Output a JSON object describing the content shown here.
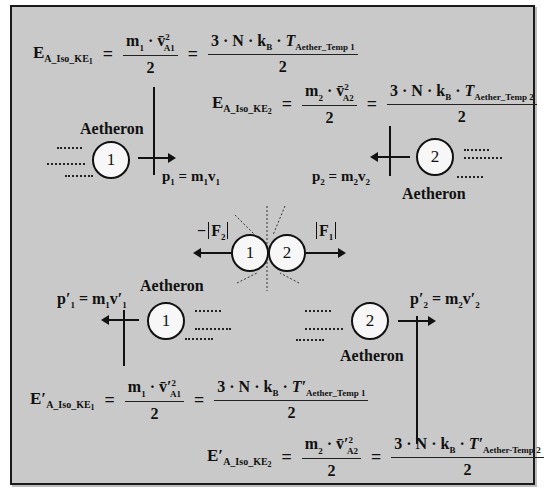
{
  "diagram": {
    "background_color": "#c9c9c9",
    "border_color": "#1a1a1a",
    "equations": {
      "ke1": {
        "lhs_main": "E",
        "lhs_sub": "A_Iso_KE",
        "lhs_subsub": "1",
        "num_mid": "m₁ · v̄²A1",
        "num_m": "m",
        "num_m_sub": "1",
        "num_v": "v̄",
        "num_v_sup": "2",
        "num_v_sub": "A1",
        "den": "2",
        "rhs_num_prefix": "3 · N · k",
        "rhs_kb_sub": "B",
        "rhs_T": "T",
        "rhs_T_sub": "Aether_Temp",
        "rhs_T_subsub": "1",
        "rhs_den": "2",
        "equals": "="
      },
      "ke2": {
        "lhs_main": "E",
        "lhs_sub": "A_Iso_KE",
        "lhs_subsub": "2",
        "num_m": "m",
        "num_m_sub": "2",
        "num_v": "v̄",
        "num_v_sup": "2",
        "num_v_sub": "A2",
        "den": "2",
        "rhs_num_prefix": "3 · N · k",
        "rhs_kb_sub": "B",
        "rhs_T": "T",
        "rhs_T_sub": "Aether_Temp",
        "rhs_T_subsub": "2",
        "rhs_den": "2",
        "equals": "="
      },
      "ke1_prime": {
        "lhs_main": "E′",
        "lhs_sub": "A_Iso_KE",
        "lhs_subsub": "1",
        "num_m": "m",
        "num_m_sub": "1",
        "num_v": "v̄′",
        "num_v_sup": "2",
        "num_v_sub": "A1",
        "den": "2",
        "rhs_num_prefix": "3 · N · k",
        "rhs_kb_sub": "B",
        "rhs_T": "T′",
        "rhs_T_sub": "Aether_Temp",
        "rhs_T_subsub": "1",
        "rhs_den": "2",
        "equals": "="
      },
      "ke2_prime": {
        "lhs_main": "E′",
        "lhs_sub": "A_Iso_KE",
        "lhs_subsub": "2",
        "num_m": "m",
        "num_m_sub": "2",
        "num_v": "v̄′",
        "num_v_sup": "2",
        "num_v_sub": "A2",
        "den": "2",
        "rhs_num_prefix": "3 · N · k",
        "rhs_kb_sub": "B",
        "rhs_T": "T′",
        "rhs_T_sub": "Aether-Temp",
        "rhs_T_subsub": "2",
        "rhs_den": "2",
        "equals": "="
      }
    },
    "particles": {
      "before_1": {
        "number": "1",
        "label": "Aetheron",
        "momentum_p": "p",
        "momentum_sub": "1",
        "momentum_rhs": " = m",
        "momentum_m_sub": "1",
        "momentum_v": "v",
        "momentum_v_sub": "1"
      },
      "before_2": {
        "number": "2",
        "label": "Aetheron",
        "momentum_p": "p",
        "momentum_sub": "2",
        "momentum_rhs": " = m",
        "momentum_m_sub": "2",
        "momentum_v": "v",
        "momentum_v_sub": "2"
      },
      "collision_1": {
        "number": "1"
      },
      "collision_2": {
        "number": "2"
      },
      "after_1": {
        "number": "1",
        "label": "Aetheron",
        "momentum_p": "p′",
        "momentum_sub": "1",
        "momentum_rhs": " = m",
        "momentum_m_sub": "1",
        "momentum_v": "v′",
        "momentum_v_sub": "1"
      },
      "after_2": {
        "number": "2",
        "label": "Aetheron",
        "momentum_p": "p′",
        "momentum_sub": "2",
        "momentum_rhs": " = m",
        "momentum_m_sub": "2",
        "momentum_v": "v′",
        "momentum_v_sub": "2"
      }
    },
    "forces": {
      "left_label": "−|F₂|",
      "left_sign": "−",
      "left_F": "F",
      "left_sub": "2",
      "right_F": "F",
      "right_sub": "1"
    }
  }
}
